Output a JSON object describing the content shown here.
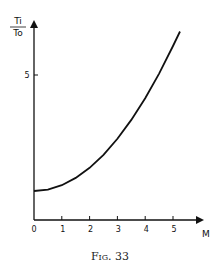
{
  "chart_data": {
    "type": "line",
    "title": "",
    "caption": "Fig. 33",
    "xlabel": "M",
    "ylabel_num": "Ti",
    "ylabel_den": "To",
    "ylabel": "Ti/To",
    "xlim": [
      0,
      5.7
    ],
    "ylim": [
      0,
      6.8
    ],
    "x_ticks": [
      0,
      1,
      2,
      3,
      4,
      5
    ],
    "x_tick_labels": [
      "0",
      "1",
      "2",
      "3",
      "4",
      "5"
    ],
    "y_ticks": [
      5
    ],
    "y_tick_labels": [
      "5"
    ],
    "grid": false,
    "legend": null,
    "series": [
      {
        "name": "Ti/To vs M",
        "x": [
          0,
          0.5,
          1,
          1.5,
          2,
          2.5,
          3,
          3.5,
          4,
          4.5,
          5,
          5.25
        ],
        "y": [
          1.0,
          1.05,
          1.2,
          1.45,
          1.8,
          2.25,
          2.8,
          3.45,
          4.2,
          5.05,
          6.0,
          6.5
        ]
      }
    ]
  }
}
